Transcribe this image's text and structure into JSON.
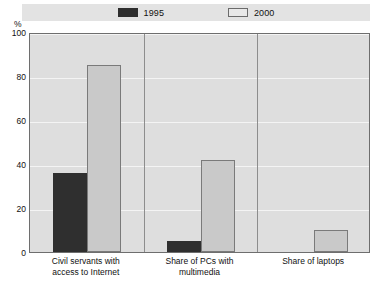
{
  "legend": {
    "entries": [
      {
        "label": "1995",
        "color": "#2f2f2f",
        "swatch": "legend-swatch-1995"
      },
      {
        "label": "2000",
        "color": "#c9c9c9",
        "swatch": "legend-swatch-2000"
      }
    ]
  },
  "axis": {
    "unit_label": "%",
    "yticks": [
      "100",
      "80",
      "60",
      "40",
      "20",
      "0"
    ]
  },
  "chart_data": {
    "type": "bar",
    "title": "",
    "subtitle": "",
    "xlabel": "",
    "ylabel": "%",
    "ylim": [
      0,
      100
    ],
    "yticks": [
      0,
      20,
      40,
      60,
      80,
      100
    ],
    "grid": true,
    "legend_position": "top",
    "categories": [
      "Civil servants with access to Internet",
      "Share of PCs with multimedia",
      "Share of laptops"
    ],
    "category_lines": [
      [
        "Civil servants with",
        "access to Internet"
      ],
      [
        "Share of PCs with",
        "multimedia"
      ],
      [
        "Share of laptops"
      ]
    ],
    "series": [
      {
        "name": "1995",
        "color": "#2f2f2f",
        "values": [
          36,
          5,
          0
        ]
      },
      {
        "name": "2000",
        "color": "#c9c9c9",
        "values": [
          85,
          42,
          10
        ]
      }
    ]
  }
}
